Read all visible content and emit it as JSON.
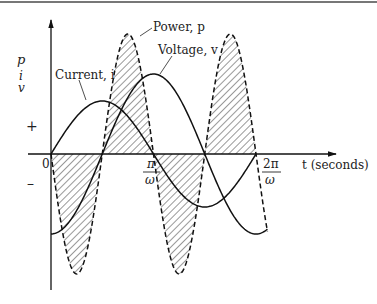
{
  "figure": {
    "axis_labels": {
      "y_p": "p",
      "y_i": "i",
      "y_v": "v",
      "x": "t (seconds)",
      "plus": "+",
      "minus": "–",
      "origin": "0"
    },
    "ticks": {
      "pi_num": "π",
      "pi_den": "ω",
      "twopi_num": "2π",
      "twopi_den": "ω"
    },
    "curves": {
      "power_label": "Power, p",
      "voltage_label": "Voltage, v",
      "current_label": "Current, i"
    }
  },
  "chart_data": {
    "type": "line",
    "title": "",
    "xlabel": "t (seconds)",
    "ylabel": "p, i, v",
    "x_ticks": [
      "0",
      "π/ω",
      "2π/ω"
    ],
    "series": [
      {
        "name": "Current, i",
        "form": "sin(ωt)",
        "relative_amplitude": 0.44
      },
      {
        "name": "Voltage, v",
        "form": "-cos(ωt)",
        "relative_amplitude": 0.67
      },
      {
        "name": "Power, p",
        "form": "v·i (shaded, dashed outline)",
        "relative_amplitude": 1.0
      }
    ],
    "x_range": [
      0,
      "2π/ω"
    ],
    "grid": false
  }
}
